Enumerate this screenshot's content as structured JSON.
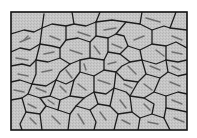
{
  "figure": {
    "type": "polygonal-cell-pattern",
    "colors": {
      "background": "#ffffff",
      "cell_fill": "#c4c4c4",
      "boundary": "#1e1e1e",
      "streak": "#6a6a6a",
      "frame": "#111111"
    },
    "frame": {
      "x": 11,
      "y": 12,
      "width": 176,
      "height": 118
    }
  }
}
